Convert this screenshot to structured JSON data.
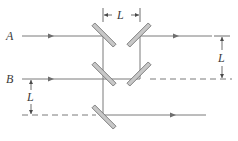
{
  "diagram": {
    "type": "optics-mirror-interferometer",
    "labels": {
      "beam_a": "A",
      "beam_b": "B",
      "dim_top": "L",
      "dim_right": "L",
      "dim_left": "L"
    },
    "colors": {
      "beam": "#7a7a7a",
      "mirror_fill": "#c8c8c8",
      "mirror_stroke": "#6e6e6e",
      "text": "#3a3a3a"
    },
    "mirrors": [
      {
        "id": "m1",
        "cx": 104,
        "cy": 35,
        "orientation": "backslash"
      },
      {
        "id": "m2",
        "cx": 139,
        "cy": 35,
        "orientation": "slash"
      },
      {
        "id": "m3",
        "cx": 104,
        "cy": 73,
        "orientation": "backslash"
      },
      {
        "id": "m4",
        "cx": 139,
        "cy": 73,
        "orientation": "slash"
      },
      {
        "id": "m5",
        "cx": 104,
        "cy": 115,
        "orientation": "backslash"
      }
    ]
  }
}
